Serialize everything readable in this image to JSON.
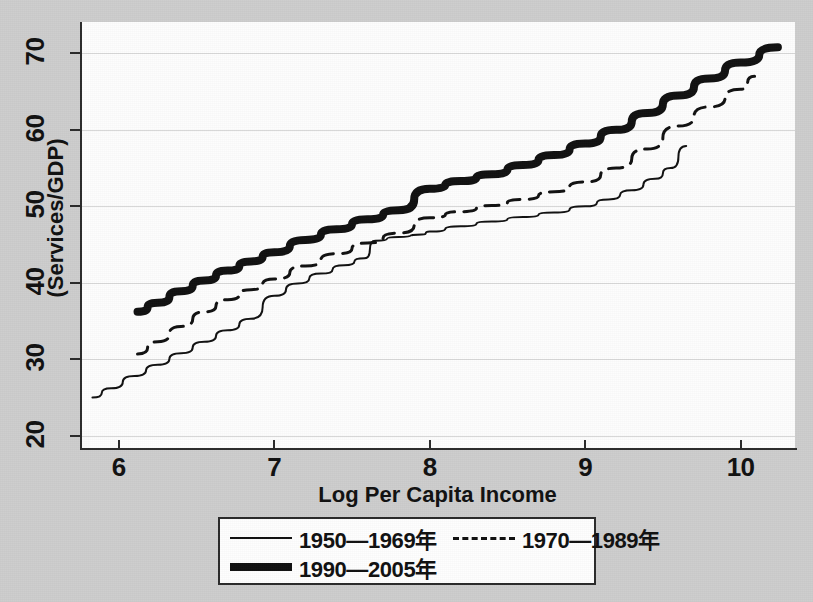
{
  "chart_data": {
    "type": "line",
    "title": "",
    "xlabel": "Log Per Capita Income",
    "ylabel": "(Services/GDP)",
    "xlim": [
      5.75,
      10.35
    ],
    "ylim": [
      18.4,
      74.1
    ],
    "xticks": [
      6,
      7,
      8,
      9,
      10
    ],
    "xtick_labels": [
      "6",
      "7",
      "8",
      "9",
      "10"
    ],
    "yticks": [
      20,
      30,
      40,
      50,
      60,
      70
    ],
    "ytick_labels": [
      "20",
      "30",
      "40",
      "50",
      "60",
      "70"
    ],
    "grid": "horizontal",
    "legend_position": "below-center",
    "series": [
      {
        "name": "1950—1969年",
        "style": "solid",
        "points": [
          [
            5.83,
            25.0
          ],
          [
            5.95,
            26.2
          ],
          [
            6.1,
            27.8
          ],
          [
            6.25,
            29.3
          ],
          [
            6.4,
            30.8
          ],
          [
            6.55,
            32.3
          ],
          [
            6.7,
            33.8
          ],
          [
            6.85,
            35.3
          ],
          [
            7.0,
            38.3
          ],
          [
            7.15,
            39.9
          ],
          [
            7.3,
            41.2
          ],
          [
            7.45,
            42.3
          ],
          [
            7.58,
            43.2
          ],
          [
            7.65,
            45.5
          ],
          [
            7.8,
            46.0
          ],
          [
            7.95,
            46.3
          ],
          [
            8.0,
            46.7
          ],
          [
            8.2,
            47.4
          ],
          [
            8.4,
            48.0
          ],
          [
            8.6,
            48.6
          ],
          [
            8.8,
            49.2
          ],
          [
            9.0,
            50.0
          ],
          [
            9.15,
            50.9
          ],
          [
            9.3,
            52.1
          ],
          [
            9.45,
            53.6
          ],
          [
            9.55,
            55.0
          ],
          [
            9.65,
            57.9
          ]
        ]
      },
      {
        "name": "1970—1989年",
        "style": "dashed",
        "points": [
          [
            6.12,
            30.7
          ],
          [
            6.25,
            32.3
          ],
          [
            6.4,
            34.3
          ],
          [
            6.55,
            36.2
          ],
          [
            6.7,
            37.8
          ],
          [
            6.85,
            39.1
          ],
          [
            7.0,
            40.5
          ],
          [
            7.2,
            42.2
          ],
          [
            7.4,
            43.8
          ],
          [
            7.6,
            45.2
          ],
          [
            7.8,
            46.5
          ],
          [
            8.0,
            48.5
          ],
          [
            8.2,
            49.3
          ],
          [
            8.4,
            50.1
          ],
          [
            8.6,
            50.9
          ],
          [
            8.8,
            51.9
          ],
          [
            9.0,
            53.2
          ],
          [
            9.2,
            55.0
          ],
          [
            9.4,
            57.5
          ],
          [
            9.6,
            60.5
          ],
          [
            9.8,
            63.0
          ],
          [
            10.0,
            65.3
          ],
          [
            10.09,
            67.0
          ]
        ]
      },
      {
        "name": "1990—2005年",
        "style": "thick",
        "points": [
          [
            6.12,
            36.2
          ],
          [
            6.25,
            37.4
          ],
          [
            6.4,
            38.9
          ],
          [
            6.55,
            40.3
          ],
          [
            6.7,
            41.6
          ],
          [
            6.85,
            42.8
          ],
          [
            7.0,
            44.0
          ],
          [
            7.2,
            45.6
          ],
          [
            7.4,
            47.0
          ],
          [
            7.6,
            48.3
          ],
          [
            7.8,
            49.5
          ],
          [
            8.0,
            52.3
          ],
          [
            8.2,
            53.3
          ],
          [
            8.4,
            54.2
          ],
          [
            8.6,
            55.4
          ],
          [
            8.8,
            56.7
          ],
          [
            9.0,
            58.2
          ],
          [
            9.2,
            60.0
          ],
          [
            9.4,
            62.2
          ],
          [
            9.6,
            64.5
          ],
          [
            9.8,
            66.7
          ],
          [
            10.0,
            68.8
          ],
          [
            10.24,
            70.8
          ]
        ]
      }
    ]
  },
  "legend": {
    "rows": [
      [
        {
          "label": "1950—1969年",
          "style": "solid"
        },
        {
          "label": "1970—1989年",
          "style": "dashed"
        }
      ],
      [
        {
          "label": "1990—2005年",
          "style": "thick"
        }
      ]
    ]
  },
  "colors": {
    "line": "#111111",
    "axis": "#2b2b2b",
    "grid": "#d8d8d8",
    "plot_background": "#fdfdfd",
    "page_background": "#cdcdcd"
  }
}
